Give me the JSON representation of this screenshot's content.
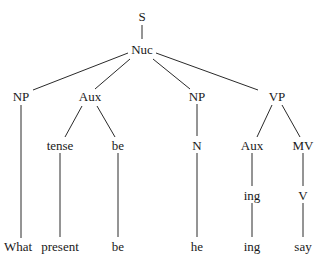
{
  "diagram": {
    "type": "syntax-tree",
    "nodes": [
      {
        "id": "S",
        "label": "S"
      },
      {
        "id": "Nuc",
        "label": "Nuc"
      },
      {
        "id": "NP1",
        "label": "NP"
      },
      {
        "id": "Aux1",
        "label": "Aux"
      },
      {
        "id": "NP2",
        "label": "NP"
      },
      {
        "id": "VP",
        "label": "VP"
      },
      {
        "id": "tense",
        "label": "tense"
      },
      {
        "id": "be1",
        "label": "be"
      },
      {
        "id": "N",
        "label": "N"
      },
      {
        "id": "Aux2",
        "label": "Aux"
      },
      {
        "id": "MV",
        "label": "MV"
      },
      {
        "id": "ing1",
        "label": "ing"
      },
      {
        "id": "V",
        "label": "V"
      },
      {
        "id": "What",
        "label": "What"
      },
      {
        "id": "present",
        "label": "present"
      },
      {
        "id": "be2",
        "label": "be"
      },
      {
        "id": "he",
        "label": "he"
      },
      {
        "id": "ing2",
        "label": "ing"
      },
      {
        "id": "say",
        "label": "say"
      }
    ],
    "edges": [
      [
        "S",
        "Nuc"
      ],
      [
        "Nuc",
        "NP1"
      ],
      [
        "Nuc",
        "Aux1"
      ],
      [
        "Nuc",
        "NP2"
      ],
      [
        "Nuc",
        "VP"
      ],
      [
        "NP1",
        "What"
      ],
      [
        "Aux1",
        "tense"
      ],
      [
        "Aux1",
        "be1"
      ],
      [
        "tense",
        "present"
      ],
      [
        "be1",
        "be2"
      ],
      [
        "NP2",
        "N"
      ],
      [
        "N",
        "he"
      ],
      [
        "VP",
        "Aux2"
      ],
      [
        "VP",
        "MV"
      ],
      [
        "Aux2",
        "ing1"
      ],
      [
        "ing1",
        "ing2"
      ],
      [
        "MV",
        "V"
      ],
      [
        "V",
        "say"
      ]
    ]
  }
}
